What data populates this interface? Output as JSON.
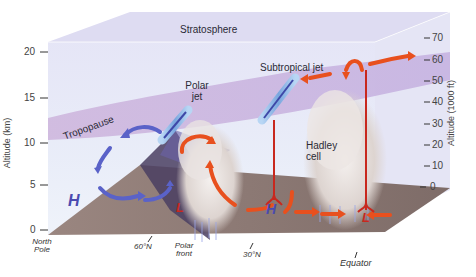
{
  "diagram": {
    "labels": {
      "stratosphere": "Stratosphere",
      "tropopause": "Tropopause",
      "polar_jet_line1": "Polar",
      "polar_jet_line2": "jet",
      "subtropical_jet": "Subtropical jet",
      "hadley_line1": "Hadley",
      "hadley_line2": "cell"
    },
    "left_axis": {
      "title": "Altitude (km)",
      "ticks": [
        "20",
        "15",
        "10",
        "5",
        "0"
      ]
    },
    "right_axis": {
      "title": "Altitude (1000 ft)",
      "ticks": [
        "70",
        "60",
        "50",
        "40",
        "30",
        "20",
        "10",
        "0"
      ]
    },
    "latitude_labels": {
      "north_pole_line1": "North",
      "north_pole_line2": "Pole",
      "lat60": "60°N",
      "polar_front_line1": "Polar",
      "polar_front_line2": "front",
      "lat30": "30°N",
      "equator": "Equator"
    },
    "pressure_markers": {
      "high": "H",
      "low": "L"
    },
    "colors": {
      "box_face": "#e6e6f6",
      "box_top": "#dcdcf2",
      "tropopause_band": "#c8b2dc",
      "ground": "#8a7872",
      "ground_dark": "#4a3e5c",
      "cold_arrow": "#5a62c8",
      "warm_arrow": "#e8501e",
      "jet_tube": "#8fb8e6",
      "cloud": "#e8e2e0"
    }
  }
}
